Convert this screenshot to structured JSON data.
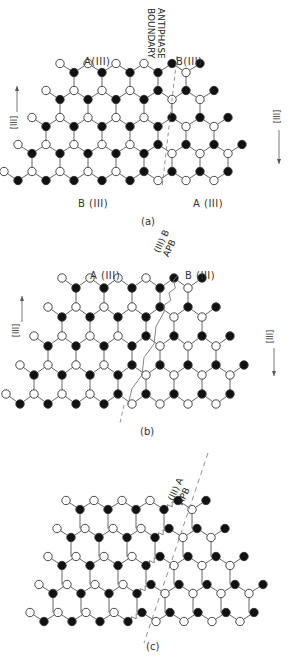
{
  "figure": {
    "panels": [
      {
        "id": "a",
        "caption": "(a)",
        "boundary_label_line1": "ANTIPHASE",
        "boundary_label_line2": "BOUNDARY",
        "top_left_label": "A(III)",
        "top_right_label": "B(III)",
        "bottom_left_label": "B (III)",
        "bottom_right_label": "A (III)",
        "left_axis_label": "[III]",
        "right_axis_label": "[III]",
        "left_arrow": "up",
        "right_arrow": "down",
        "top": 0,
        "lattice": {
          "origin_x": 60,
          "origin_y": 68,
          "dx": 28,
          "dy": 27,
          "rows": 4,
          "cols_per_row": [
            5,
            6,
            7,
            8
          ],
          "row_shift": -14,
          "boundary_col": [
            4,
            4,
            5,
            5
          ],
          "boundary_style": "dashed-straight"
        }
      },
      {
        "id": "b",
        "caption": "(b)",
        "apb_label_line1": "(III) B",
        "apb_label_line2": "APB",
        "top_left_label": "A (III)",
        "top_right_label": "B (III)",
        "left_axis_label": "[III]",
        "right_axis_label": "[III]",
        "left_arrow": "up",
        "right_arrow": "down",
        "top": 0,
        "lattice": {
          "origin_x": 62,
          "origin_y": 283,
          "dx": 28,
          "dy": 29,
          "rows": 4,
          "cols_per_row": [
            5,
            6,
            7,
            8
          ],
          "row_shift": -14,
          "boundary_col": [
            4,
            4,
            4,
            4
          ],
          "boundary_style": "zigzag-inclined"
        }
      },
      {
        "id": "c",
        "caption": "(c)",
        "apb_label_line1": "(III) A",
        "apb_label_line2": "APB",
        "top": 0,
        "lattice": {
          "origin_x": 66,
          "origin_y": 505,
          "dx": 28,
          "dy": 28,
          "rows": 4,
          "cols_per_row": [
            5,
            6,
            7,
            8
          ],
          "row_shift": -9,
          "boundary_col": [
            4,
            4,
            4,
            4
          ],
          "boundary_style": "zigzag-horizontal"
        }
      }
    ],
    "colors": {
      "filled_atom": "#111111",
      "open_atom": "#ffffff",
      "bond": "#666666",
      "boundary": "#777777"
    }
  }
}
